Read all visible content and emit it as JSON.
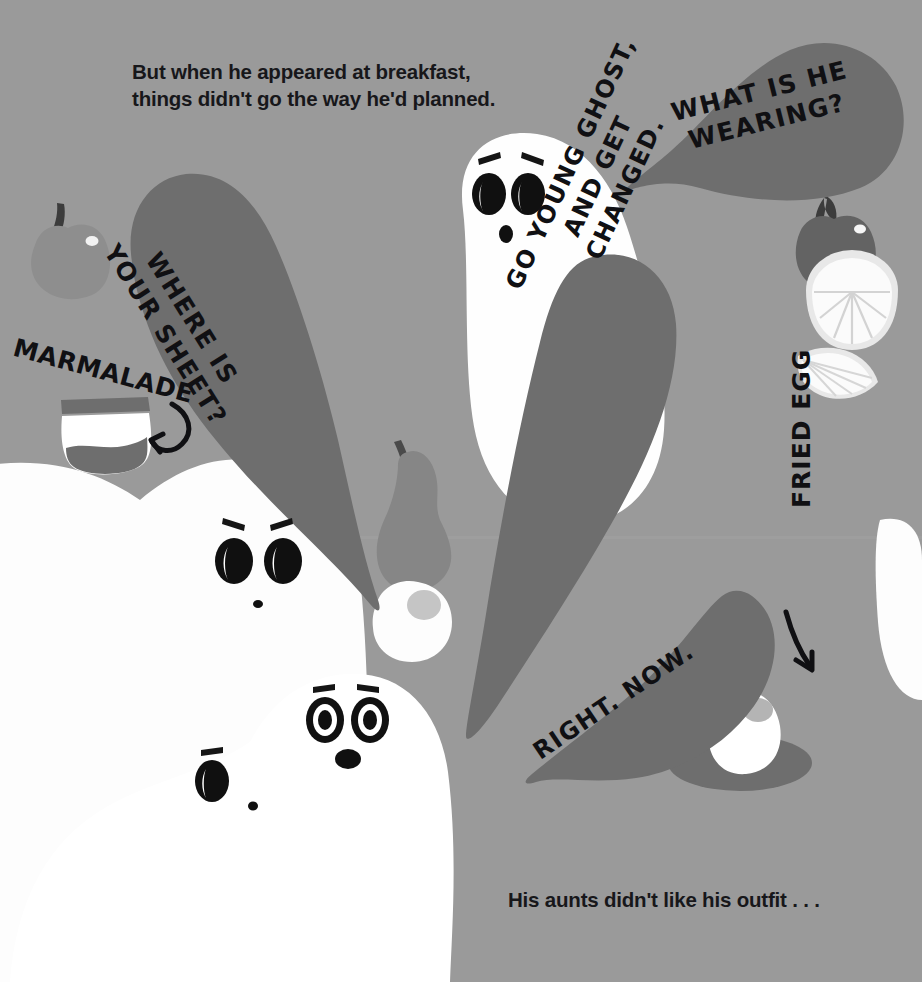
{
  "page": {
    "width": 922,
    "height": 982,
    "background_color": "#9a9a9a",
    "bubble_color": "#6e6e6e",
    "ghost_color": "#fefefe",
    "ink_color": "#101013",
    "food_dark_color": "#6e6e6e",
    "food_mid_color": "#8a8a8a"
  },
  "narration": {
    "top": "But when he appeared at breakfast,\nthings didn't go the way he'd planned.",
    "bottom": "His aunts didn't like his outfit . . ."
  },
  "speech_bubbles": [
    {
      "id": "wearing",
      "text": "WHAT IS HE\nWEARING?"
    },
    {
      "id": "sheet",
      "text": "WHERE IS\nYOUR SHEET?"
    },
    {
      "id": "changed",
      "text": "GO YOUNG GHOST,\nAND GET\nCHANGED."
    },
    {
      "id": "rightnow",
      "text": "RIGHT. NOW."
    }
  ],
  "labels": [
    {
      "id": "marmalade",
      "text": "MARMALADE"
    },
    {
      "id": "fried-egg",
      "text": "FRIED EGG"
    }
  ],
  "ghosts": [
    {
      "id": "centre-ghost",
      "expression": "surprised"
    },
    {
      "id": "left-aunt-ghost",
      "expression": "angry"
    },
    {
      "id": "front-aunt-ghost",
      "expression": "shocked"
    },
    {
      "id": "small-ghost",
      "expression": "peeking"
    }
  ],
  "food_items": [
    {
      "id": "apple-left",
      "name": "apple"
    },
    {
      "id": "marmalade-jar",
      "name": "marmalade-jar"
    },
    {
      "id": "pear",
      "name": "pear"
    },
    {
      "id": "apple-right",
      "name": "apple"
    },
    {
      "id": "grapefruit-half",
      "name": "grapefruit-half"
    },
    {
      "id": "citrus-wedge",
      "name": "citrus-wedge"
    },
    {
      "id": "fried-egg-loose",
      "name": "fried-egg"
    },
    {
      "id": "frying-pan",
      "name": "frying-pan"
    },
    {
      "id": "fried-egg-pan",
      "name": "fried-egg"
    }
  ]
}
